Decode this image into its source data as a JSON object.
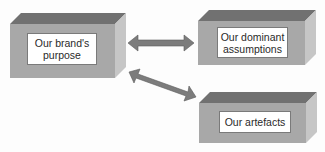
{
  "diagram": {
    "blocks": [
      {
        "id": "brand-purpose",
        "label": "Our brand's purpose"
      },
      {
        "id": "dominant-assumptions",
        "label": "Our dominant assumptions"
      },
      {
        "id": "artefacts",
        "label": "Our artefacts"
      }
    ],
    "connections": [
      {
        "from": "brand-purpose",
        "to": "dominant-assumptions",
        "type": "bidirectional"
      },
      {
        "from": "brand-purpose",
        "to": "artefacts",
        "type": "bidirectional"
      }
    ],
    "colors": {
      "front": "#a9a9a9",
      "top": "#707070",
      "side": "#c4c4c4",
      "arrow": "#7c7c7c"
    }
  }
}
